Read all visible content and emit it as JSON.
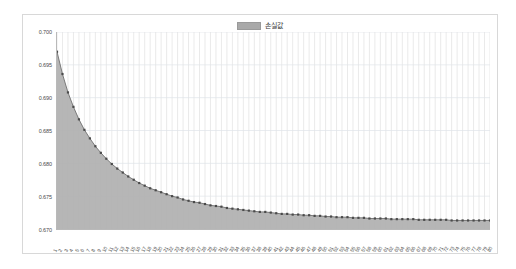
{
  "legend": {
    "label": "손실값",
    "swatch_color": "#a9a9a9",
    "position": "top-center"
  },
  "chart_data": {
    "type": "area",
    "title": "",
    "subtitle": "",
    "xlabel": "",
    "ylabel": "",
    "ylim": [
      0.67,
      0.7
    ],
    "xlim": [
      1,
      80
    ],
    "grid": true,
    "grid_vertical": true,
    "grid_horizontal": true,
    "legend_position": "top-center",
    "series_name": "손실값",
    "line_color": "#6f6f6f",
    "fill_color": "#b0b0b0",
    "marker_color": "#4a4a4a",
    "ytick_labels": [
      "0.700",
      "0.695",
      "0.690",
      "0.685",
      "0.680",
      "0.675",
      "0.670"
    ],
    "ytick_values": [
      0.7,
      0.695,
      0.69,
      0.685,
      0.68,
      0.675,
      0.67
    ],
    "categories": [
      "1",
      "2",
      "3",
      "4",
      "5",
      "6",
      "7",
      "8",
      "9",
      "10",
      "11",
      "12",
      "13",
      "14",
      "15",
      "16",
      "17",
      "18",
      "19",
      "20",
      "21",
      "22",
      "23",
      "24",
      "25",
      "26",
      "27",
      "28",
      "29",
      "30",
      "31",
      "32",
      "33",
      "34",
      "35",
      "36",
      "37",
      "38",
      "39",
      "40",
      "41",
      "42",
      "43",
      "44",
      "45",
      "46",
      "47",
      "48",
      "49",
      "50",
      "51",
      "52",
      "53",
      "54",
      "55",
      "56",
      "57",
      "58",
      "59",
      "60",
      "61",
      "62",
      "63",
      "64",
      "65",
      "66",
      "67",
      "68",
      "69",
      "70",
      "71",
      "72",
      "73",
      "74",
      "75",
      "76",
      "77",
      "78",
      "79",
      "80"
    ],
    "values": [
      0.697,
      0.6936,
      0.6908,
      0.6886,
      0.6867,
      0.6851,
      0.6838,
      0.6826,
      0.6816,
      0.6807,
      0.6799,
      0.6792,
      0.6786,
      0.678,
      0.6775,
      0.677,
      0.6766,
      0.6762,
      0.6759,
      0.6756,
      0.6753,
      0.675,
      0.6748,
      0.6745,
      0.6743,
      0.6741,
      0.674,
      0.6738,
      0.6736,
      0.6735,
      0.6734,
      0.6732,
      0.6731,
      0.673,
      0.6729,
      0.6728,
      0.6727,
      0.6726,
      0.6726,
      0.6725,
      0.6724,
      0.6723,
      0.6723,
      0.6722,
      0.6722,
      0.6721,
      0.6721,
      0.672,
      0.672,
      0.6719,
      0.6719,
      0.6718,
      0.6718,
      0.6718,
      0.6717,
      0.6717,
      0.6717,
      0.6716,
      0.6716,
      0.6716,
      0.6716,
      0.6715,
      0.6715,
      0.6715,
      0.6715,
      0.6715,
      0.6714,
      0.6714,
      0.6714,
      0.6714,
      0.6714,
      0.6714,
      0.6713,
      0.6713,
      0.6713,
      0.6713,
      0.6713,
      0.6713,
      0.6713,
      0.6713
    ]
  }
}
